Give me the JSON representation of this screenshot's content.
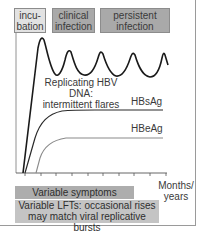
{
  "phases": [
    {
      "line1": "incu-",
      "line2": "bation",
      "color": "#e2e2e2"
    },
    {
      "line1": "clinical",
      "line2": "infection",
      "color": "#a9a9a9"
    },
    {
      "line1": "persistent",
      "line2": "infection",
      "color": "#a9a9a9"
    }
  ],
  "labels": {
    "dna_line1": "Replicating HBV DNA:",
    "dna_line2": "intermittent flares",
    "hbsag": "HBsAg",
    "hbeag": "HBeAg",
    "x_axis_line1": "Months/",
    "x_axis_line2": "years"
  },
  "bottom_bars": {
    "symptoms": "Variable symptoms",
    "lfts_line1": "Variable LFTs: occasional rises",
    "lfts_line2": "may match viral replicative bursts"
  },
  "axis": {
    "tick_count": 10
  },
  "colors": {
    "dna_curve": "#1a1a1a",
    "hbsag_curve": "#2a2a2a",
    "hbeag_curve": "#8a8a8a",
    "axis": "#555555"
  }
}
